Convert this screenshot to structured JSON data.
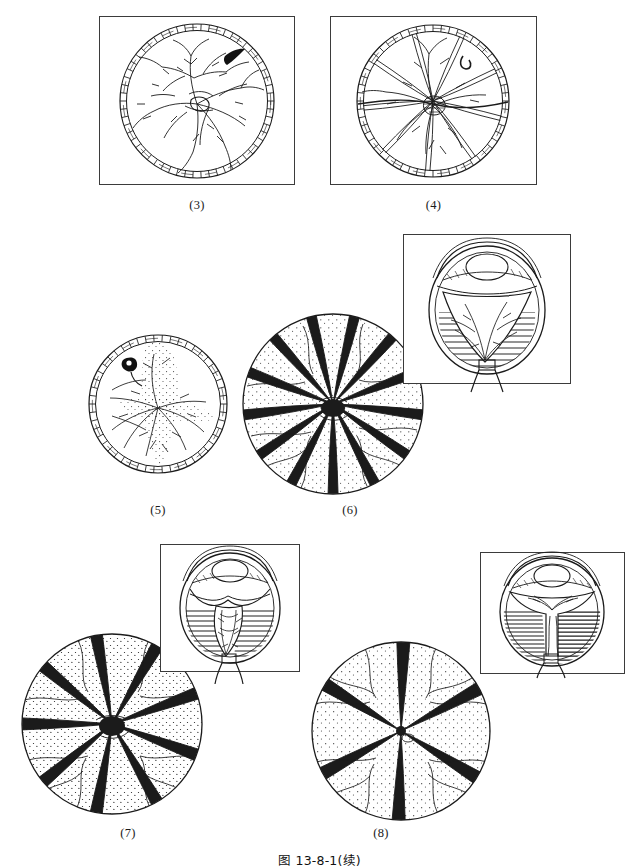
{
  "figure": {
    "caption": "图 13-8-1(续)",
    "label_prefix": "(",
    "label_suffix": ")"
  },
  "panels": [
    {
      "id": "panel-3",
      "label": "(3)",
      "kind": "fundus-in-frame",
      "framed": true,
      "description": "Fundus view, early proliferative vitreoretinopathy: branching retinal vessels with early epiretinal traction and a dark retinal break at upper temporal quadrant",
      "has_rim_band": true,
      "marker": "black-comma-tear",
      "fold_count": 0,
      "stipple": false
    },
    {
      "id": "panel-4",
      "label": "(4)",
      "kind": "fundus-in-frame",
      "framed": true,
      "description": "Fundus view, progressing traction: dense stellate central membrane with radiating retinal folds and a horizontal fold line",
      "has_rim_band": true,
      "marker": "hook-tear",
      "fold_count": 9,
      "stipple": false
    },
    {
      "id": "panel-5",
      "label": "(5)",
      "kind": "fundus-plain",
      "framed": false,
      "description": "Fundus view with ciliary band: dense central proliferative mass, stippled vitreous opacity and converging folds",
      "has_rim_band": true,
      "marker": "black-hook-tear",
      "fold_count": 7,
      "stipple": true
    },
    {
      "id": "panel-6",
      "label": "(6)",
      "kind": "fundus-plus-inset",
      "framed": false,
      "description": "Star-fold retinal detachment, radiating stellate folds with stippled detached retina",
      "has_rim_band": false,
      "fold_count": 13,
      "stipple": true,
      "inset": {
        "id": "inset-6",
        "description": "Sagittal eye cross-section: open funnel detachment, retina elevated with vessels converging to optic disc, hatched peripheral retina",
        "hatch": "light-both-sides",
        "funnel": "open-wide"
      }
    },
    {
      "id": "panel-7",
      "label": "(7)",
      "kind": "fundus-plus-inset",
      "framed": false,
      "description": "Advanced star-fold detachment with bold dark radiating folds and heavy stippling",
      "has_rim_band": false,
      "fold_count": 9,
      "stipple": true,
      "inset": {
        "id": "inset-7",
        "description": "Sagittal eye cross-section: narrowing funnel detachment with dense hatching on both walls and irregular central retinal stalk",
        "hatch": "dense-both-sides",
        "funnel": "narrow"
      }
    },
    {
      "id": "panel-8",
      "label": "(8)",
      "kind": "fundus-plus-inset",
      "framed": false,
      "description": "Closed funnel stage: six broad dark radiating folds converging to a tight central point",
      "has_rim_band": false,
      "fold_count": 6,
      "stipple": true,
      "inset": {
        "id": "inset-8",
        "description": "Sagittal eye cross-section: closed funnel detachment, solid hatched retina on both sides with narrow central stalk to optic nerve",
        "hatch": "solid-both-sides",
        "funnel": "closed"
      }
    }
  ],
  "colors": {
    "ink": "#1b1b1b",
    "frame": "#3b3b3b",
    "paper": "#ffffff",
    "hatch": "#2a2a2a"
  }
}
